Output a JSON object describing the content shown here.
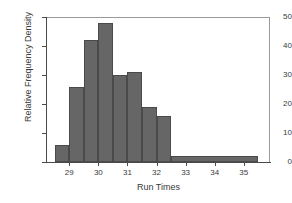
{
  "chart_data": {
    "type": "bar",
    "title": "",
    "subtitle": "",
    "xlabel": "Run Times",
    "ylabel": "Relative Frequency Density",
    "xlim": [
      28.2,
      35.9
    ],
    "ylim": [
      0,
      50
    ],
    "grid": false,
    "legend": null,
    "bin_width": 0.5,
    "bar_color": "#666666",
    "bar_edge_color": "#4a4a4a",
    "background_color": "#ffffff",
    "xticks": [
      29,
      30,
      31,
      32,
      33,
      34,
      35
    ],
    "xtick_labels": [
      "29",
      "30",
      "31",
      "32",
      "33",
      "34",
      "35"
    ],
    "yticks": [
      0,
      10,
      20,
      30,
      40,
      50
    ],
    "ytick_labels": [
      "0",
      "10",
      "20",
      "30",
      "40",
      "50"
    ],
    "bins": [
      {
        "x0": 28.5,
        "x1": 29.0,
        "value": 6
      },
      {
        "x0": 29.0,
        "x1": 29.5,
        "value": 26
      },
      {
        "x0": 29.5,
        "x1": 30.0,
        "value": 42
      },
      {
        "x0": 30.0,
        "x1": 30.5,
        "value": 48
      },
      {
        "x0": 30.5,
        "x1": 31.0,
        "value": 30
      },
      {
        "x0": 31.0,
        "x1": 31.5,
        "value": 31
      },
      {
        "x0": 31.5,
        "x1": 32.0,
        "value": 19
      },
      {
        "x0": 32.0,
        "x1": 32.5,
        "value": 16
      },
      {
        "x0": 32.5,
        "x1": 35.5,
        "value": 2
      }
    ],
    "categories": [
      "28.5-29.0",
      "29.0-29.5",
      "29.5-30.0",
      "30.0-30.5",
      "30.5-31.0",
      "31.0-31.5",
      "31.5-32.0",
      "32.0-32.5",
      "32.5-35.5"
    ],
    "values": [
      6,
      26,
      42,
      48,
      30,
      31,
      19,
      16,
      2
    ]
  }
}
